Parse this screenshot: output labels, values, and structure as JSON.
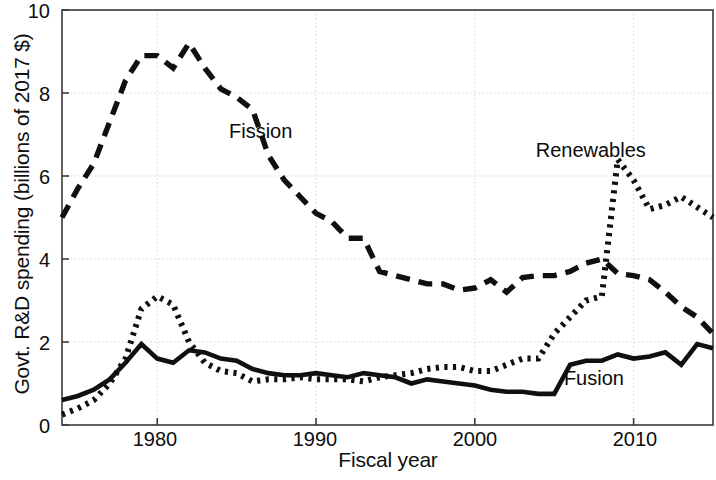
{
  "figure": {
    "background": "#ffffff",
    "ink_color": "#101010",
    "grid_color": "#d9d9d9",
    "frame_color": "#3a3a3a"
  },
  "axes": {
    "xlabel": "Fiscal year",
    "ylabel": "Govt. R&D spending (billions of 2017 $)",
    "x_ticks": [
      "1980",
      "1990",
      "2000",
      "2010"
    ],
    "y_ticks": [
      "0",
      "2",
      "4",
      "6",
      "8",
      "10"
    ]
  },
  "labels": {
    "fission": "Fission",
    "renewables": "Renewables",
    "fusion": "Fusion"
  },
  "chart_data": {
    "type": "line",
    "title": "",
    "xlabel": "Fiscal year",
    "ylabel": "Govt. R&D spending (billions of 2017 $)",
    "xlim": [
      1974,
      2015
    ],
    "ylim": [
      0,
      10
    ],
    "x_ticks": [
      1980,
      1990,
      2000,
      2010
    ],
    "y_ticks": [
      0,
      2,
      4,
      6,
      8,
      10
    ],
    "grid": true,
    "legend": "inline-annotations",
    "x": [
      1974,
      1975,
      1976,
      1977,
      1978,
      1979,
      1980,
      1981,
      1982,
      1983,
      1984,
      1985,
      1986,
      1987,
      1988,
      1989,
      1990,
      1991,
      1992,
      1993,
      1994,
      1995,
      1996,
      1997,
      1998,
      1999,
      2000,
      2001,
      2002,
      2003,
      2004,
      2005,
      2006,
      2007,
      2008,
      2009,
      2010,
      2011,
      2012,
      2013,
      2014,
      2015
    ],
    "series": [
      {
        "name": "Fission",
        "style": "dashed",
        "color": "#101010",
        "values": [
          5.0,
          5.7,
          6.3,
          7.3,
          8.3,
          8.9,
          8.9,
          8.6,
          9.2,
          8.6,
          8.1,
          7.9,
          7.6,
          6.5,
          5.9,
          5.5,
          5.1,
          4.9,
          4.5,
          4.5,
          3.7,
          3.6,
          3.5,
          3.4,
          3.4,
          3.25,
          3.3,
          3.5,
          3.2,
          3.55,
          3.6,
          3.6,
          3.7,
          3.9,
          4.0,
          3.65,
          3.6,
          3.5,
          3.2,
          2.85,
          2.6,
          2.2
        ]
      },
      {
        "name": "Renewables",
        "style": "dotted",
        "color": "#101010",
        "values": [
          0.25,
          0.4,
          0.6,
          1.0,
          1.6,
          2.8,
          3.1,
          2.9,
          2.0,
          1.5,
          1.3,
          1.25,
          1.05,
          1.1,
          1.1,
          1.15,
          1.1,
          1.1,
          1.1,
          1.05,
          1.15,
          1.2,
          1.25,
          1.35,
          1.4,
          1.4,
          1.3,
          1.3,
          1.45,
          1.6,
          1.6,
          2.2,
          2.6,
          3.0,
          3.1,
          6.4,
          5.9,
          5.2,
          5.3,
          5.5,
          5.25,
          5.0
        ]
      },
      {
        "name": "Fusion",
        "style": "solid",
        "color": "#101010",
        "values": [
          0.6,
          0.7,
          0.85,
          1.1,
          1.5,
          1.95,
          1.6,
          1.5,
          1.8,
          1.75,
          1.6,
          1.55,
          1.35,
          1.25,
          1.2,
          1.2,
          1.25,
          1.2,
          1.15,
          1.25,
          1.2,
          1.15,
          1.0,
          1.1,
          1.05,
          1.0,
          0.95,
          0.85,
          0.8,
          0.8,
          0.75,
          0.75,
          1.45,
          1.55,
          1.55,
          1.7,
          1.6,
          1.65,
          1.75,
          1.45,
          1.95,
          1.85
        ]
      }
    ],
    "annotations": [
      {
        "text": "Fission",
        "x": 1986.5,
        "y": 7.05
      },
      {
        "text": "Renewables",
        "x": 2007.3,
        "y": 6.6
      },
      {
        "text": "Fusion",
        "x": 2007.5,
        "y": 1.1
      }
    ]
  }
}
